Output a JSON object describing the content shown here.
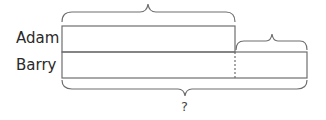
{
  "diagram": {
    "type": "bar-model",
    "rows": [
      {
        "label": "Adam",
        "length": "long"
      },
      {
        "label": "Barry",
        "length": "long + extra"
      }
    ],
    "question_label": "?",
    "colors": {
      "stroke": "#6e6e6e",
      "text": "#2a2a2a"
    }
  }
}
